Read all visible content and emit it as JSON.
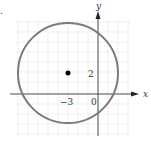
{
  "figure": {
    "marker": ".",
    "axes": {
      "x_label": "x",
      "y_label": "y",
      "origin_label": "0"
    },
    "ticks": {
      "x_tick_label": "−3",
      "y_tick_label": "2"
    },
    "circle": {
      "center": [
        -3,
        2
      ],
      "radius": 5,
      "stroke_color": "#7a7a7a"
    },
    "center_point": {
      "x": -3,
      "y": 2,
      "color": "#000000"
    },
    "grid_color": "#e6e6e6"
  }
}
